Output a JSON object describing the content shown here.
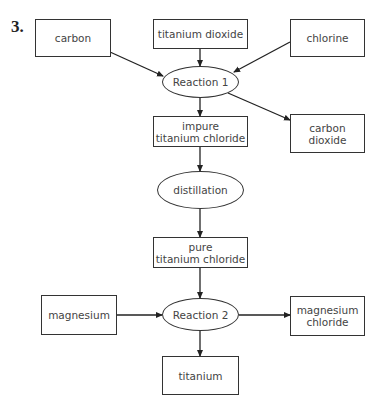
{
  "question_number": "3.",
  "nodes": {
    "carbon": {
      "label": "carbon",
      "shape": "box"
    },
    "titanium_dioxide": {
      "label": "titanium dioxide",
      "shape": "box"
    },
    "chlorine": {
      "label": "chlorine",
      "shape": "box"
    },
    "reaction1": {
      "label": "Reaction 1",
      "shape": "ellipse"
    },
    "impure_ticl": {
      "label": "impure\ntitanium chloride",
      "shape": "box"
    },
    "carbon_dioxide": {
      "label": "carbon\ndioxide",
      "shape": "box"
    },
    "distillation": {
      "label": "distillation",
      "shape": "ellipse"
    },
    "pure_ticl": {
      "label": "pure\ntitanium chloride",
      "shape": "box"
    },
    "magnesium": {
      "label": "magnesium",
      "shape": "box"
    },
    "reaction2": {
      "label": "Reaction 2",
      "shape": "ellipse"
    },
    "magnesium_chloride": {
      "label": "magnesium\nchloride",
      "shape": "box"
    },
    "titanium": {
      "label": "titanium",
      "shape": "box"
    }
  },
  "edges": [
    {
      "from": "carbon",
      "to": "reaction1"
    },
    {
      "from": "titanium_dioxide",
      "to": "reaction1"
    },
    {
      "from": "chlorine",
      "to": "reaction1"
    },
    {
      "from": "reaction1",
      "to": "impure_ticl"
    },
    {
      "from": "reaction1",
      "to": "carbon_dioxide"
    },
    {
      "from": "impure_ticl",
      "to": "distillation"
    },
    {
      "from": "distillation",
      "to": "pure_ticl"
    },
    {
      "from": "pure_ticl",
      "to": "reaction2"
    },
    {
      "from": "magnesium",
      "to": "reaction2"
    },
    {
      "from": "reaction2",
      "to": "magnesium_chloride"
    },
    {
      "from": "reaction2",
      "to": "titanium"
    }
  ]
}
